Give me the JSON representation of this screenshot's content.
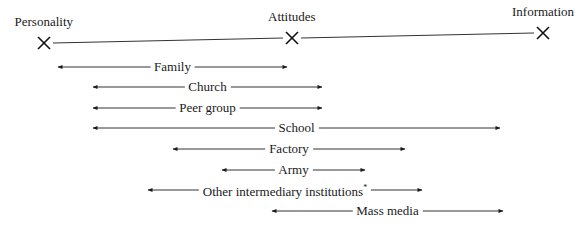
{
  "nodes": [
    {
      "label": "Personality",
      "x": 44,
      "y": 43
    },
    {
      "label": "Attitudes",
      "x": 292,
      "y": 38
    },
    {
      "label": "Information",
      "x": 543,
      "y": 33
    }
  ],
  "institutions": [
    {
      "label": "Family",
      "x1": 58,
      "x2": 287,
      "y": 67
    },
    {
      "label": "Church",
      "x1": 93,
      "x2": 322,
      "y": 87
    },
    {
      "label": "Peer group",
      "x1": 93,
      "x2": 322,
      "y": 108
    },
    {
      "label": "School",
      "x1": 93,
      "x2": 500,
      "y": 128
    },
    {
      "label": "Factory",
      "x1": 173,
      "x2": 405,
      "y": 149
    },
    {
      "label": "Army",
      "x1": 222,
      "x2": 365,
      "y": 170
    },
    {
      "label": "Other intermediary institutions",
      "footnote_mark": "*",
      "x1": 148,
      "x2": 422,
      "y": 190
    },
    {
      "label": "Mass media",
      "x1": 272,
      "x2": 503,
      "y": 211
    }
  ]
}
